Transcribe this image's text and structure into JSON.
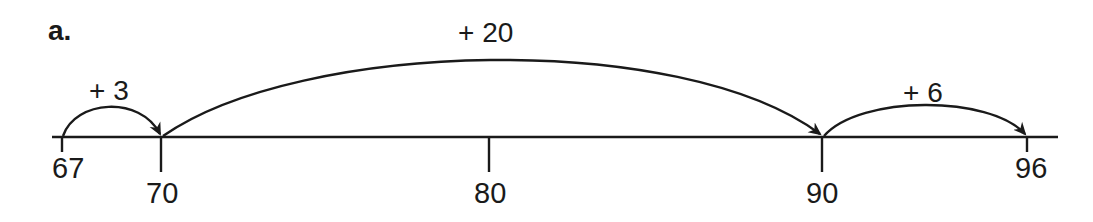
{
  "part_label": "a.",
  "number_line": {
    "ticks": [
      {
        "value": 67,
        "label": "67",
        "x": 62,
        "long": false
      },
      {
        "value": 70,
        "label": "70",
        "x": 161,
        "long": true
      },
      {
        "value": 80,
        "label": "80",
        "x": 489,
        "long": true
      },
      {
        "value": 90,
        "label": "90",
        "x": 822,
        "long": true
      },
      {
        "value": 96,
        "label": "96",
        "x": 1027,
        "long": false
      }
    ]
  },
  "jumps": [
    {
      "from": 67,
      "to": 70,
      "label": "+ 3"
    },
    {
      "from": 70,
      "to": 90,
      "label": "+ 20"
    },
    {
      "from": 90,
      "to": 96,
      "label": "+ 6"
    }
  ]
}
